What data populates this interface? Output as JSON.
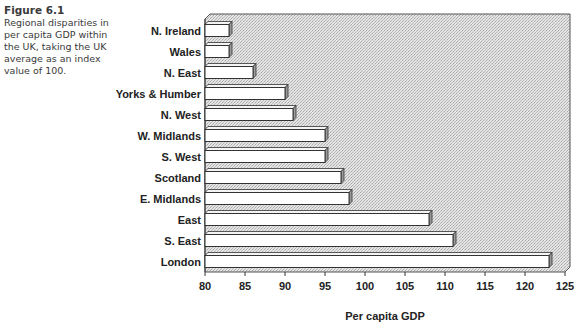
{
  "caption": {
    "figure_label": "Figure 6.1",
    "text": "Regional disparities in per capita GDP within the UK, taking the UK average as an index value of 100."
  },
  "chart_data": {
    "type": "bar",
    "orientation": "horizontal",
    "title": "",
    "xlabel": "Per capita GDP",
    "ylabel": "",
    "categories": [
      "N. Ireland",
      "Wales",
      "N. East",
      "Yorks & Humber",
      "N. West",
      "W. Midlands",
      "S. West",
      "Scotland",
      "E. Midlands",
      "East",
      "S. East",
      "London"
    ],
    "values": [
      83,
      83,
      86,
      90,
      91,
      95,
      95,
      97,
      98,
      108,
      111,
      123
    ],
    "xlim": [
      80,
      125
    ],
    "xticks": [
      80,
      85,
      90,
      95,
      100,
      105,
      110,
      115,
      120,
      125
    ],
    "grid": false,
    "legend": null,
    "style": "3d-bars-on-stippled-background"
  },
  "colors": {
    "plot_background": "#d9d9d9",
    "bar_fill": "#ffffff",
    "bar_outline": "#333333",
    "bar_side": "#9a9a9a"
  }
}
